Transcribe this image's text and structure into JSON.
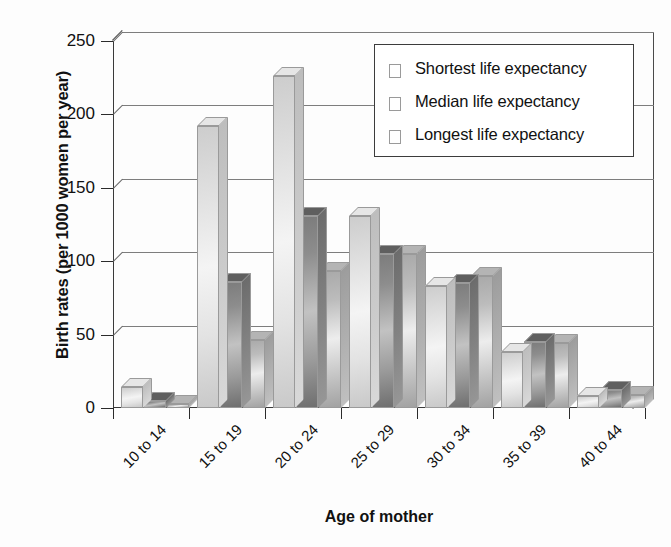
{
  "chart_data": {
    "type": "bar",
    "title": "",
    "xlabel": "Age of mother",
    "ylabel": "Birth rates (per 1000 women per year)",
    "categories": [
      "10 to 14",
      "15 to 19",
      "20 to 24",
      "25 to 29",
      "30 to 34",
      "35 to 39",
      "40 to 44"
    ],
    "series": [
      {
        "name": "Shortest life expectancy",
        "values": [
          14,
          192,
          226,
          131,
          83,
          38,
          8
        ]
      },
      {
        "name": "Median life expectancy",
        "values": [
          5,
          86,
          131,
          105,
          85,
          45,
          12
        ]
      },
      {
        "name": "Longest life expectancy",
        "values": [
          3,
          46,
          93,
          105,
          90,
          44,
          9
        ]
      }
    ],
    "ylim": [
      0,
      250
    ],
    "yticks": [
      0,
      50,
      100,
      150,
      200,
      250
    ],
    "ytick_labels": [
      "0",
      "50",
      "100",
      "150",
      "200",
      "250"
    ],
    "grid": "horizontal",
    "legend_position": "top-right",
    "style": "3d-bars-grayscale",
    "colors": {
      "series0": "#e3e3e3",
      "series1": "#8d8d8d",
      "series2": "#bcbcbc",
      "axis": "#2b2b2b",
      "grid": "#7d7d7d",
      "text": "#111111",
      "background": "#fdfdfd"
    }
  },
  "legend": {
    "entries": [
      "Shortest life expectancy",
      "Median life expectancy",
      "Longest life expectancy"
    ]
  }
}
